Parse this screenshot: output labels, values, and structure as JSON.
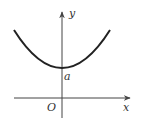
{
  "diagram": {
    "type": "function-graph",
    "labels": {
      "y_axis": "y",
      "x_axis": "x",
      "origin": "O",
      "intercept": "a"
    },
    "colors": {
      "curve": "#222222",
      "axes": "#444444",
      "text": "#333333"
    }
  }
}
